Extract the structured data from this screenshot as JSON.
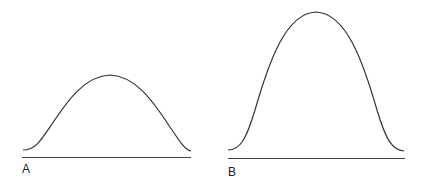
{
  "panels": [
    {
      "label": "A",
      "description": "Low, broad bell-shaped curve above baseline"
    },
    {
      "label": "B",
      "description": "Tall bell-shaped curve above baseline"
    }
  ],
  "colors": {
    "stroke": "#333333",
    "background": "#ffffff"
  }
}
